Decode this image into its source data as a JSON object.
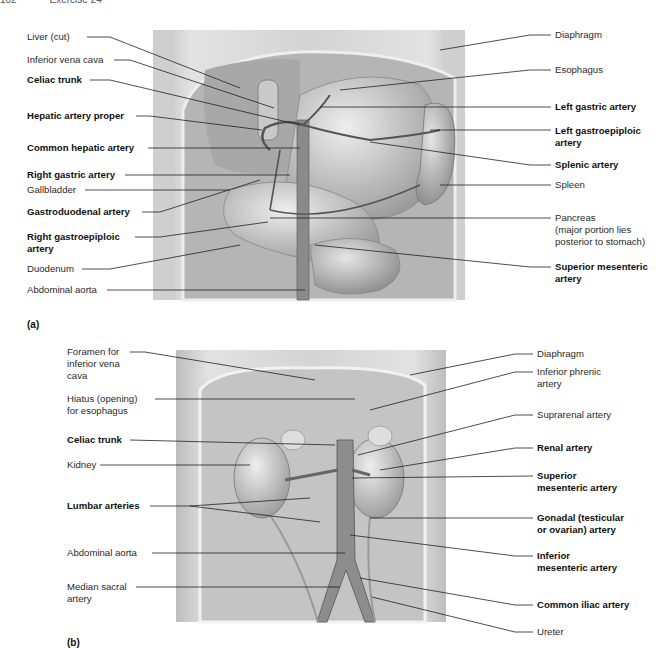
{
  "header": {
    "page_number": "102",
    "exercise": "Exercise 24"
  },
  "figure_a": {
    "panel_label": "(a)",
    "left_labels": [
      {
        "text": "Liver (cut)",
        "bold": false
      },
      {
        "text": "Inferior vena cava",
        "bold": false
      },
      {
        "text": "Celiac trunk",
        "bold": true
      },
      {
        "text": "Hepatic artery proper",
        "bold": true
      },
      {
        "text": "Common hepatic artery",
        "bold": true
      },
      {
        "text": "Right gastric artery",
        "bold": true
      },
      {
        "text": "Gallbladder",
        "bold": false
      },
      {
        "text": "Gastroduodenal artery",
        "bold": true
      },
      {
        "text": "Right gastroepiploic\nartery",
        "bold": true
      },
      {
        "text": "Duodenum",
        "bold": false
      },
      {
        "text": "Abdominal aorta",
        "bold": false
      }
    ],
    "right_labels": [
      {
        "text": "Diaphragm",
        "bold": false
      },
      {
        "text": "Esophagus",
        "bold": false
      },
      {
        "text": "Left gastric artery",
        "bold": true
      },
      {
        "text": "Left gastroepiploic\nartery",
        "bold": true
      },
      {
        "text": "Splenic artery",
        "bold": true
      },
      {
        "text": "Spleen",
        "bold": false
      },
      {
        "text": "Pancreas\n(major portion lies\nposterior to stomach)",
        "bold": false
      },
      {
        "text": "Superior mesenteric\nartery",
        "bold": true
      }
    ]
  },
  "figure_b": {
    "panel_label": "(b)",
    "left_labels": [
      {
        "text": "Foramen for\ninferior vena\ncava",
        "bold": false
      },
      {
        "text": "Hiatus (opening)\nfor esophagus",
        "bold": false
      },
      {
        "text": "Celiac trunk",
        "bold": true
      },
      {
        "text": "Kidney",
        "bold": false
      },
      {
        "text": "Lumbar arteries",
        "bold": true
      },
      {
        "text": "Abdominal aorta",
        "bold": false
      },
      {
        "text": "Median sacral\nartery",
        "bold": false
      }
    ],
    "right_labels": [
      {
        "text": "Diaphragm",
        "bold": false
      },
      {
        "text": "Inferior phrenic\nartery",
        "bold": false
      },
      {
        "text": "Suprarenal artery",
        "bold": false
      },
      {
        "text": "Renal artery",
        "bold": true
      },
      {
        "text": "Superior\nmesenteric artery",
        "bold": true
      },
      {
        "text": "Gonadal (testicular\nor ovarian) artery",
        "bold": true
      },
      {
        "text": "Inferior\nmesenteric artery",
        "bold": true
      },
      {
        "text": "Common iliac artery",
        "bold": true
      },
      {
        "text": "Ureter",
        "bold": false
      }
    ]
  }
}
